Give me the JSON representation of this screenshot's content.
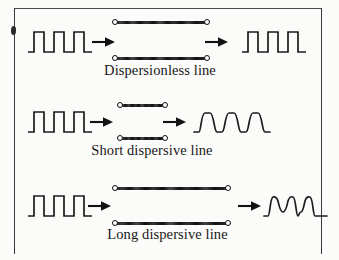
{
  "figure": {
    "ink_color": "#1c1c1c",
    "background_color": "#fbfbf9"
  },
  "rows": [
    {
      "id": "dispersionless",
      "caption": "Dispersionless line",
      "input_signal": "square-pulse-train",
      "output_signal": "square-pulse-train",
      "line_length": "medium",
      "input_arrow": "right-arrow",
      "output_arrow": "right-arrow",
      "terminals": [
        "input-terminal",
        "output-terminal"
      ],
      "pulse_count": 3
    },
    {
      "id": "short-dispersive",
      "caption": "Short dispersive line",
      "input_signal": "square-pulse-train",
      "output_signal": "rounded-pulse-train",
      "line_length": "short",
      "input_arrow": "right-arrow",
      "output_arrow": "right-arrow",
      "terminals": [
        "input-terminal",
        "output-terminal"
      ],
      "pulse_count": 3
    },
    {
      "id": "long-dispersive",
      "caption": "Long dispersive line",
      "input_signal": "square-pulse-train",
      "output_signal": "distorted-merged-pulse-train",
      "line_length": "long",
      "input_arrow": "right-arrow",
      "output_arrow": "right-arrow",
      "terminals": [
        "input-terminal",
        "output-terminal"
      ],
      "pulse_count": 3
    }
  ]
}
